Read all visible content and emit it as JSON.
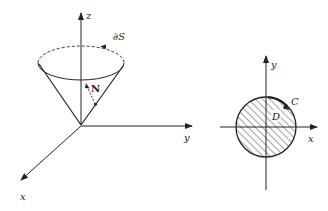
{
  "figure_left": {
    "description": "Cone surface S with boundary curve dS and normal vector N in 3D axes",
    "labels": {
      "z_axis": "z",
      "y_axis": "y",
      "x_axis": "x",
      "boundary": "∂S",
      "normal": "N"
    }
  },
  "figure_right": {
    "description": "Projection disk D in xy-plane with boundary curve C",
    "labels": {
      "y_axis": "y",
      "x_axis": "x",
      "curve": "C",
      "region": "D"
    }
  },
  "colors": {
    "ink": "#222222",
    "background": "#ffffff"
  }
}
